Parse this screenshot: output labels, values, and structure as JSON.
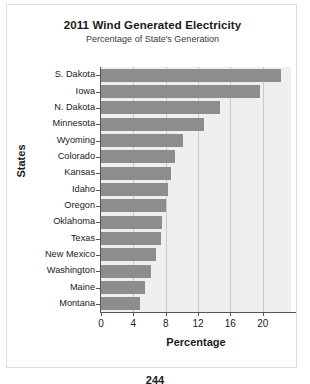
{
  "chart_data": {
    "type": "bar",
    "orientation": "horizontal",
    "title": "2011 Wind Generated Electricity",
    "subtitle": "Percentage of State's Generation",
    "xlabel": "Percentage",
    "ylabel": "States",
    "xlim": [
      0,
      23.5
    ],
    "xticks": [
      0,
      4,
      8,
      12,
      16,
      20
    ],
    "grid": true,
    "legend": "none",
    "bar_color": "#8d8d8d",
    "plot_background": "#efefef",
    "categories": [
      "S. Dakota",
      "Iowa",
      "N. Dakota",
      "Minnesota",
      "Wyoming",
      "Colorado",
      "Kansas",
      "Idaho",
      "Oregon",
      "Oklahoma",
      "Texas",
      "New Mexico",
      "Washington",
      "Maine",
      "Montana"
    ],
    "values": [
      22.3,
      19.7,
      14.7,
      12.7,
      10.1,
      9.2,
      8.6,
      8.3,
      8.1,
      7.5,
      7.4,
      6.8,
      6.2,
      5.4,
      4.8
    ]
  },
  "footer": {
    "page_number": "244"
  }
}
